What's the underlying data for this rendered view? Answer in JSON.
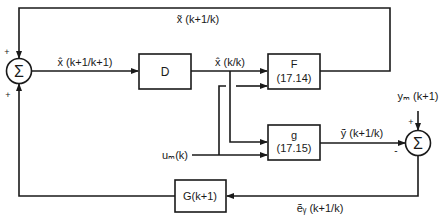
{
  "diagram": {
    "type": "block-diagram",
    "colors": {
      "stroke": "#1a1a1a",
      "background": "#ffffff"
    },
    "blocks": {
      "D": {
        "label": "D"
      },
      "F": {
        "label": "F",
        "ref": "(17.14)"
      },
      "g": {
        "label": "g",
        "ref": "(17.15)"
      },
      "G": {
        "label": "G(k+1)"
      }
    },
    "summers": {
      "sum1": {
        "symbol": "Σ",
        "sign_top": "+",
        "sign_bottom": "+"
      },
      "sum2": {
        "symbol": "Σ",
        "sign_top": "+",
        "sign_left": "-"
      }
    },
    "signals": {
      "x_pred": "x̃ (k+1/k)",
      "x_upd": "x̂ (k+1/k+1)",
      "x_filt": "x̂ (k/k)",
      "y_pred": "ỹ (k+1/k)",
      "y_meas": "yₘ (k+1)",
      "u_meas": "uₘ(k)",
      "e_y": "ẽᵧ (k+1/k)"
    }
  }
}
